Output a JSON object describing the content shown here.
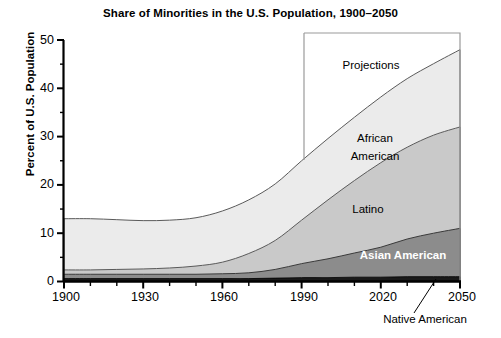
{
  "chart_data": {
    "type": "area",
    "title": "Share of Minorities in the U.S. Population, 1900–2050",
    "xlabel": "",
    "ylabel": "Percent of U.S. Population",
    "xlim": [
      1900,
      2050
    ],
    "ylim": [
      0,
      50
    ],
    "grid": false,
    "legend_position": "inline-annotations",
    "stacked": true,
    "x_major_ticks": [
      1900,
      1930,
      1960,
      1990,
      2020,
      2050
    ],
    "x_minor_tick_interval": 10,
    "y_major_ticks": [
      0,
      10,
      20,
      30,
      40,
      50
    ],
    "y_minor_tick_interval": 5,
    "x": [
      1900,
      1910,
      1920,
      1930,
      1940,
      1950,
      1960,
      1970,
      1980,
      1990,
      2000,
      2010,
      2020,
      2030,
      2040,
      2050
    ],
    "series": [
      {
        "name": "Native American",
        "color": "#1a1a1a",
        "values": [
          0.6,
          0.6,
          0.6,
          0.6,
          0.6,
          0.6,
          0.6,
          0.6,
          0.7,
          0.8,
          0.8,
          0.9,
          0.9,
          1.0,
          1.0,
          1.0
        ]
      },
      {
        "name": "Asian American",
        "color": "#8c8c8c",
        "values": [
          0.9,
          0.9,
          0.9,
          0.9,
          0.9,
          0.9,
          1.0,
          1.2,
          1.8,
          2.9,
          3.9,
          5.0,
          6.2,
          7.8,
          9.0,
          10.0
        ]
      },
      {
        "name": "Latino",
        "color": "#c9c9c9",
        "values": [
          0.9,
          0.9,
          1.0,
          1.1,
          1.3,
          1.7,
          2.4,
          4.0,
          6.0,
          9.0,
          12.2,
          15.0,
          17.5,
          19.0,
          20.3,
          21.0
        ]
      },
      {
        "name": "African American",
        "color": "#ebebeb",
        "values": [
          10.6,
          10.6,
          10.3,
          10.0,
          9.9,
          10.0,
          10.6,
          11.1,
          11.7,
          12.3,
          12.7,
          13.1,
          13.6,
          14.2,
          14.8,
          16.0
        ]
      }
    ],
    "stack_tops": [
      13.0,
      13.0,
      12.8,
      12.6,
      12.7,
      13.2,
      14.6,
      16.9,
      20.2,
      25.0,
      29.6,
      34.0,
      38.2,
      42.0,
      45.1,
      48.0
    ],
    "annotations": [
      {
        "name": "projections",
        "text": "Projections",
        "start_year": 1990,
        "end_year": 2050,
        "box": true
      },
      {
        "name": "african-american",
        "text": "African American"
      },
      {
        "name": "latino",
        "text": "Latino"
      },
      {
        "name": "asian-american",
        "text": "Asian American"
      },
      {
        "name": "native-american",
        "text": "Native American",
        "leader_line": true
      }
    ]
  },
  "chart": {
    "title": "Share of Minorities in the U.S. Population, 1900–2050",
    "y_axis_title": "Percent of U.S. Population",
    "y_ticks": [
      "50",
      "40",
      "30",
      "20",
      "10",
      "0"
    ],
    "x_ticks": [
      "1900",
      "1930",
      "1960",
      "1990",
      "2020",
      "2050"
    ],
    "labels": {
      "projections": "Projections",
      "african_american_line1": "African",
      "african_american_line2": "American",
      "latino": "Latino",
      "asian_american": "Asian American",
      "native_american": "Native American"
    },
    "colors": {
      "native_american": "#1a1a1a",
      "asian_american": "#8c8c8c",
      "latino": "#c9c9c9",
      "african_american": "#ebebeb",
      "axis": "#000000",
      "background": "#ffffff"
    }
  }
}
